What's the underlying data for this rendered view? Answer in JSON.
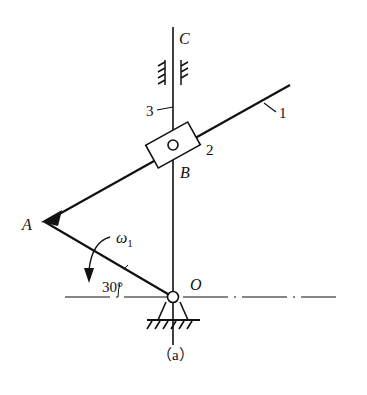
{
  "diagram": {
    "caption": "（a）",
    "points": {
      "A": "A",
      "B": "B",
      "C": "C",
      "O": "O"
    },
    "members": {
      "link1": "1",
      "slider2": "2",
      "rod3": "3"
    },
    "angle_label": "30°",
    "angular_velocity": {
      "symbol": "ω",
      "subscript": "1"
    },
    "colors": {
      "line": "#111111",
      "background": "#ffffff"
    }
  }
}
